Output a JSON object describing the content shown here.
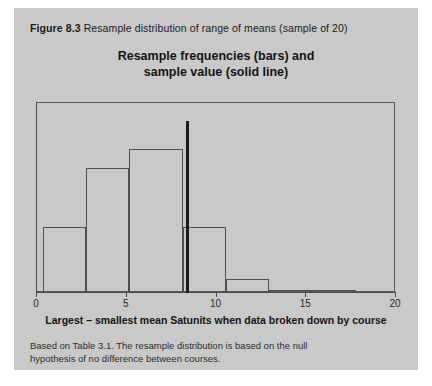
{
  "figure": {
    "number": "Figure 8.3",
    "caption": "Resample distribution of range of means (sample of 20)",
    "note": "Based on Table 3.1. The resample distribution is based on the null hypothesis of no difference between courses."
  },
  "chart_data": {
    "type": "bar",
    "title_line1": "Resample frequencies (bars) and",
    "title_line2": "sample value (solid line)",
    "title": "Resample frequencies (bars) and sample value (solid line)",
    "xlabel": "Largest – smallest mean Satunits when data broken down by course",
    "ylabel": "",
    "xlim": [
      0,
      20
    ],
    "ylim": [
      0,
      1
    ],
    "xticks": [
      0,
      5,
      10,
      15,
      20
    ],
    "xtick_labels": [
      "0",
      "5",
      "10",
      "15",
      "20"
    ],
    "yticks": [],
    "grid": false,
    "legend": null,
    "bin_edges": [
      0.4,
      2.8,
      5.2,
      8.2,
      10.6,
      13.0,
      15.4,
      17.8
    ],
    "bin_heights": [
      0.38,
      0.72,
      0.83,
      0.38,
      0.075,
      0.012,
      0.012
    ],
    "annotations": [
      {
        "name": "sample-value-line",
        "type": "vline",
        "x": 8.4,
        "label": "sample value (solid line)",
        "color": "#231a17"
      }
    ]
  },
  "colors": {
    "panel_background": "#c9c9c9",
    "page_background": "#ffffff",
    "axis": "#4a4a4a",
    "bar_outline": "#4f4f4f",
    "sample_line": "#231a17",
    "text": "#1b1b1b"
  }
}
